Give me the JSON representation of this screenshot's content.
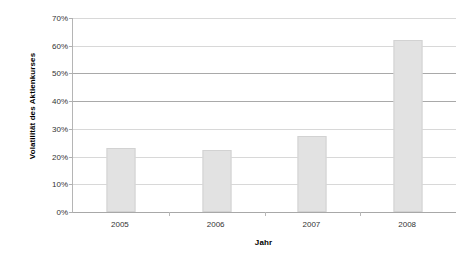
{
  "chart_data": {
    "type": "bar",
    "title": "",
    "xlabel": "Jahr",
    "ylabel": "Volatilität des Aktienkurses",
    "categories": [
      "2005",
      "2006",
      "2007",
      "2008"
    ],
    "values": [
      23,
      22.5,
      27.5,
      62
    ],
    "ylim": [
      0,
      70
    ],
    "ytick_values": [
      0,
      10,
      20,
      30,
      40,
      50,
      60,
      70
    ],
    "ytick_labels": [
      "0%",
      "10%",
      "20%",
      "30%",
      "40%",
      "50%",
      "60%",
      "70%"
    ],
    "grid": true,
    "legend": "none",
    "series": [
      {
        "name": "Volatilität des Aktienkurses",
        "values": [
          23,
          22.5,
          27.5,
          62
        ],
        "color": "#e2e2e2",
        "border_color": "#d2d2d2"
      }
    ],
    "colors": {
      "bar_fill": "#e2e2e2",
      "bar_border": "#d2d2d2",
      "gridline": "#d8d8d8",
      "gridline_strong": "#a9a9a9",
      "axis": "#a8a8a8",
      "text": "#333333",
      "title_text": "#000000",
      "background": "#ffffff"
    }
  }
}
